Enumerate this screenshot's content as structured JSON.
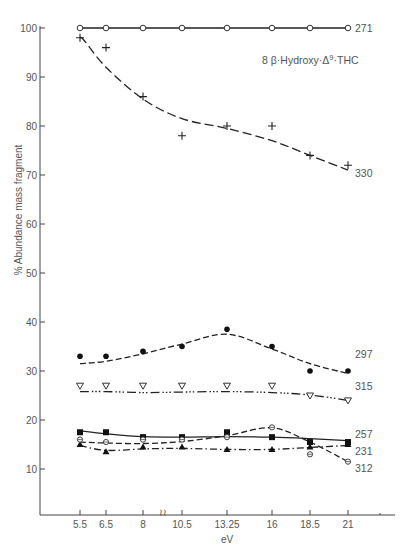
{
  "chart_data": {
    "type": "line",
    "title_parts": {
      "prefix": "8 β·Hydroxy·Δ",
      "sup": "9",
      "suffix": "·THC"
    },
    "xlabel": "eV",
    "ylabel": "% Abundance mass fragment",
    "x": [
      5.5,
      6.5,
      8,
      10.5,
      13.25,
      16,
      18.5,
      21
    ],
    "x_tick_labels": [
      "5.5",
      "6.5",
      "8",
      "10.5",
      "13.25",
      "16",
      "18.5",
      "21"
    ],
    "x_axis_break_between": [
      8,
      10.5
    ],
    "y_ticks": [
      10,
      20,
      30,
      40,
      50,
      60,
      70,
      80,
      90,
      100
    ],
    "ylim": [
      0,
      100
    ],
    "grid": false,
    "legend_position": "inline labels at right end of each curve",
    "series": [
      {
        "name": "271",
        "marker": "open-circle",
        "line": "solid",
        "values": [
          100,
          100,
          100,
          100,
          100,
          100,
          100,
          100
        ]
      },
      {
        "name": "330",
        "marker": "plus",
        "line": "long-dash",
        "values": [
          98,
          96,
          86,
          78,
          80,
          80,
          74,
          72
        ]
      },
      {
        "name": "297",
        "marker": "filled-circle",
        "line": "dash",
        "values": [
          33,
          33,
          34,
          35,
          38.5,
          35,
          30,
          30
        ]
      },
      {
        "name": "315",
        "marker": "open-triangle-down",
        "line": "dash-dot-dot",
        "values": [
          27,
          27,
          27,
          27,
          27,
          27,
          25,
          24
        ]
      },
      {
        "name": "257",
        "marker": "filled-square",
        "line": "solid",
        "values": [
          17.5,
          17.5,
          16.5,
          16.5,
          17.5,
          16.5,
          15.5,
          15.5
        ]
      },
      {
        "name": "231",
        "marker": "filled-triangle-up",
        "line": "dash-dot",
        "values": [
          15,
          13.5,
          14.5,
          14.5,
          14,
          14,
          14.5,
          15
        ]
      },
      {
        "name": "312",
        "marker": "theta-circle",
        "line": "dash",
        "values": [
          16,
          15.5,
          16,
          16,
          16.5,
          18.5,
          13,
          11.5
        ]
      }
    ]
  }
}
